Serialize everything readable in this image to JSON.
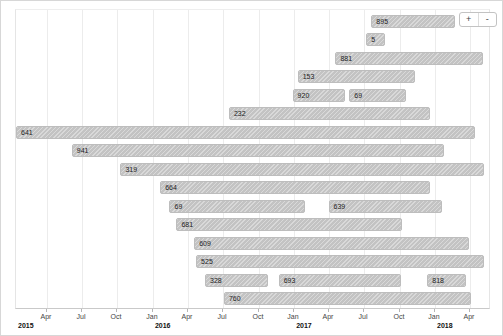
{
  "chart_data": {
    "type": "bar",
    "subtype": "gantt-timeline",
    "title": "",
    "xlabel": "",
    "ylabel": "",
    "grid": true,
    "legend": false,
    "x_axis": {
      "start": "2015-01-01",
      "end": "2018-05-20",
      "ticks": [
        {
          "date": "2015-04-01",
          "label": "Apr"
        },
        {
          "date": "2015-07-01",
          "label": "Jul"
        },
        {
          "date": "2015-10-01",
          "label": "Oct"
        },
        {
          "date": "2016-01-01",
          "label": "Jan"
        },
        {
          "date": "2016-04-01",
          "label": "Apr"
        },
        {
          "date": "2016-07-01",
          "label": "Jul"
        },
        {
          "date": "2016-10-01",
          "label": "Oct"
        },
        {
          "date": "2017-01-01",
          "label": "Jan"
        },
        {
          "date": "2017-04-01",
          "label": "Apr"
        },
        {
          "date": "2017-07-01",
          "label": "Jul"
        },
        {
          "date": "2017-10-01",
          "label": "Oct"
        },
        {
          "date": "2018-01-01",
          "label": "Jan"
        },
        {
          "date": "2018-04-01",
          "label": "Apr"
        }
      ],
      "years": [
        {
          "date": "2015-01-01",
          "label": "2015"
        },
        {
          "date": "2016-01-01",
          "label": "2016"
        },
        {
          "date": "2017-01-01",
          "label": "2017"
        },
        {
          "date": "2018-01-01",
          "label": "2018"
        }
      ]
    },
    "rows": [
      [
        {
          "label": "895",
          "start": "2017-07-20",
          "end": "2018-02-22"
        }
      ],
      [
        {
          "label": "5",
          "start": "2017-07-07",
          "end": "2017-08-25"
        }
      ],
      [
        {
          "label": "881",
          "start": "2017-04-18",
          "end": "2018-05-05"
        }
      ],
      [
        {
          "label": "153",
          "start": "2017-01-10",
          "end": "2017-11-11"
        }
      ],
      [
        {
          "label": "920",
          "start": "2016-12-28",
          "end": "2017-05-14"
        },
        {
          "label": "69",
          "start": "2017-05-24",
          "end": "2017-10-18"
        }
      ],
      [
        {
          "label": "232",
          "start": "2016-07-16",
          "end": "2017-12-19"
        }
      ],
      [
        {
          "label": "641",
          "start": "2015-01-11",
          "end": "2018-04-14"
        }
      ],
      [
        {
          "label": "941",
          "start": "2015-06-05",
          "end": "2018-01-24"
        }
      ],
      [
        {
          "label": "319",
          "start": "2015-10-09",
          "end": "2018-05-08"
        }
      ],
      [
        {
          "label": "664",
          "start": "2016-01-20",
          "end": "2017-12-19"
        }
      ],
      [
        {
          "label": "69",
          "start": "2016-02-13",
          "end": "2017-01-28"
        },
        {
          "label": "639",
          "start": "2017-03-31",
          "end": "2018-01-19"
        }
      ],
      [
        {
          "label": "681",
          "start": "2016-03-02",
          "end": "2017-10-08"
        }
      ],
      [
        {
          "label": "609",
          "start": "2016-04-17",
          "end": "2018-03-30"
        }
      ],
      [
        {
          "label": "525",
          "start": "2016-04-22",
          "end": "2018-05-08"
        }
      ],
      [
        {
          "label": "328",
          "start": "2016-05-15",
          "end": "2016-10-25"
        },
        {
          "label": "693",
          "start": "2016-11-22",
          "end": "2017-10-05"
        },
        {
          "label": "818",
          "start": "2017-12-12",
          "end": "2018-03-22"
        }
      ],
      [
        {
          "label": "760",
          "start": "2016-07-03",
          "end": "2018-04-04"
        }
      ]
    ]
  },
  "controls": {
    "zoom_in_label": "+",
    "zoom_out_label": "-"
  },
  "colors": {
    "bar_fill": "#c9c9c9",
    "bar_border": "#bdbdbd",
    "grid_line": "#ececec",
    "axis_line": "#c9c9c9",
    "bar_label_text": "#1a1a1a",
    "tick_label_text": "#444444"
  }
}
